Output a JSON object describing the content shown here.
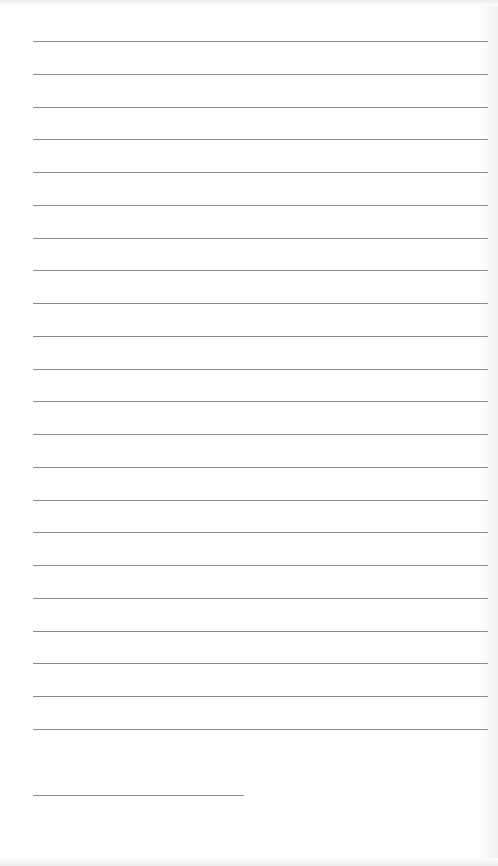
{
  "page": {
    "type": "lined-paper",
    "background_color": "#ffffff",
    "line_color": "#8c8c8c",
    "line_left_x": 33,
    "line_right_x": 488,
    "first_line_y": 41,
    "line_spacing": 32.76,
    "full_line_count": 22,
    "short_line": {
      "y": 795,
      "x_start": 33,
      "x_end": 244
    }
  }
}
